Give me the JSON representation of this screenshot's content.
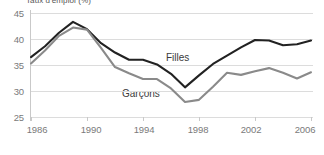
{
  "chart_data": {
    "type": "line",
    "title": "Taux d'emploi (%)",
    "xlabel": "",
    "ylabel": "",
    "ylim": [
      25,
      45
    ],
    "xlim": [
      1986,
      2006
    ],
    "yticks": [
      45,
      40,
      35,
      30,
      25
    ],
    "xticks": [
      1986,
      1990,
      1994,
      1998,
      2002,
      2006
    ],
    "grid": true,
    "legend_position": "inline-annotation",
    "x": [
      1986,
      1987,
      1988,
      1989,
      1990,
      1991,
      1992,
      1993,
      1994,
      1995,
      1996,
      1997,
      1998,
      1999,
      2000,
      2001,
      2002,
      2003,
      2004,
      2005,
      2006
    ],
    "series": [
      {
        "name": "Filles",
        "color": "#222222",
        "values": [
          36.5,
          38.6,
          41.2,
          43.3,
          41.9,
          39.2,
          37.4,
          36.0,
          36.0,
          35.1,
          33.3,
          30.7,
          33.0,
          35.2,
          36.8,
          38.4,
          39.8,
          39.7,
          38.8,
          39.0,
          39.7
        ]
      },
      {
        "name": "Garçons",
        "color": "#8a8a8a",
        "values": [
          35.3,
          37.8,
          40.6,
          42.2,
          41.8,
          38.3,
          34.6,
          33.4,
          32.3,
          32.3,
          30.5,
          27.9,
          28.3,
          30.8,
          33.5,
          33.1,
          33.8,
          34.4,
          33.5,
          32.4,
          33.6
        ]
      }
    ],
    "annotations": [
      {
        "text": "Filles",
        "x": 1996,
        "y": 36.4
      },
      {
        "text": "Garçons",
        "x": 1993,
        "y": 29.6
      }
    ]
  },
  "axis": {
    "y_labels": [
      "45",
      "40",
      "35",
      "30",
      "25"
    ],
    "x_labels": [
      "1986",
      "1990",
      "1994",
      "1998",
      "2002",
      "2006"
    ]
  },
  "labels": {
    "filles": "Filles",
    "garcons": "Garçons",
    "title": "Taux d'emploi (%)"
  }
}
